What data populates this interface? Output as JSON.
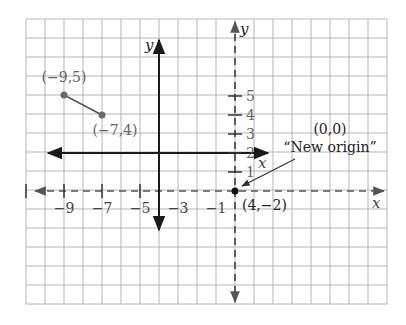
{
  "diagram": {
    "type": "coordinate-translation-graph",
    "colors": {
      "grid": "#b5b5b5",
      "axis_solid": "#1a1a1a",
      "axis_dashed": "#444444",
      "segment": "#555555",
      "point_gray": "#6a6a6a",
      "point_black": "#111111",
      "text_dark": "#222222",
      "text_gray": "#666666"
    },
    "grid": {
      "left": 26,
      "top": 19,
      "cols": 19,
      "rows": 15,
      "cell": 19
    },
    "solid_axes": {
      "x_label": "x",
      "y_label": "y"
    },
    "dashed_axes": {
      "x_label": "x",
      "y_label": "y"
    },
    "x_ticks": [
      {
        "label": "−9",
        "value": -9
      },
      {
        "label": "−7",
        "value": -7
      },
      {
        "label": "−5",
        "value": -5
      },
      {
        "label": "−3",
        "value": -3
      },
      {
        "label": "−1",
        "value": -1
      }
    ],
    "y_ticks": [
      {
        "label": "1",
        "value": 1
      },
      {
        "label": "2",
        "value": 2
      },
      {
        "label": "3",
        "value": 3
      },
      {
        "label": "4",
        "value": 4
      },
      {
        "label": "5",
        "value": 5
      }
    ],
    "points": [
      {
        "label": "(−9,5)",
        "x": -9,
        "y": 5
      },
      {
        "label": "(−7,4)",
        "x": -7,
        "y": 4
      }
    ],
    "origin_point": {
      "label": "(4,−2)",
      "x": 4,
      "y": -2
    },
    "annotation": {
      "line1": "(0,0)",
      "line2": "“New origin”"
    }
  }
}
